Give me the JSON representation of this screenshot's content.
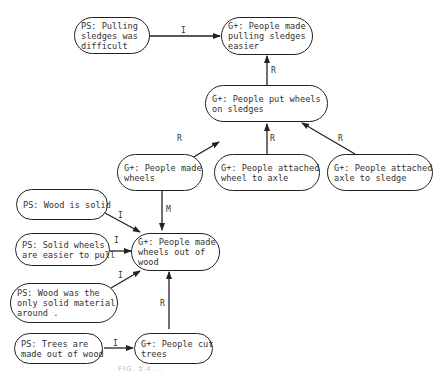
{
  "nodes": {
    "ps_pulling": "PS: Pulling\nsledges was\ndifficult",
    "g_pulling_easier": "G+: People made\npulling sledges\neasier",
    "g_put_wheels": "G+: People put wheels\non sledges",
    "g_made_wheels": "G+: People made\nwheels",
    "g_wheel_axle": "G+: People attached\nwheel to axle",
    "g_axle_sledge": "G+: People attached\naxle to sledge",
    "ps_wood_solid": "PS: Wood is solid",
    "ps_solid_wheels": "PS: Solid wheels\nare easier to pull",
    "g_wheels_wood": "G+: People made\nwheels out of\nwood",
    "ps_only_solid": "PS: Wood was the\nonly solid material\naround .",
    "ps_trees": "PS: Trees are\nmade out of wood",
    "g_cut_trees": "G+: People cut\ntrees"
  },
  "edges": {
    "ps_pulling_to_g_pulling": "I",
    "put_wheels_to_pulling": "R",
    "made_wheels_to_put_wheels": "R",
    "wheel_axle_to_put_wheels": "R",
    "axle_sledge_to_put_wheels": "R",
    "made_wheels_to_wheels_wood": "M",
    "wood_solid_to_wheels_wood": "I",
    "solid_wheels_to_wheels_wood": "I",
    "only_solid_to_wheels_wood": "I",
    "cut_trees_to_wheels_wood": "R",
    "trees_to_cut_trees": "I"
  },
  "caption": "FIG. 5.4 ..."
}
